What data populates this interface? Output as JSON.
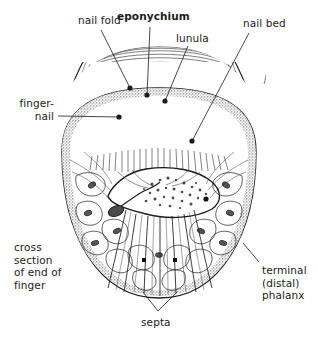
{
  "figure": {
    "title": "cross section of end of finger",
    "type": "anatomical-line-drawing",
    "background_color": "#ffffff",
    "ink_color": "#1b1b1b",
    "nail_plate_color": "#e8e8e8",
    "skin_rim_color": "#9a9a9a"
  },
  "labels": {
    "nail_fold": {
      "text": "nail fold",
      "bold": false,
      "x": 78,
      "y": 14,
      "align": "left"
    },
    "eponychium": {
      "text": "eponychium",
      "bold": true,
      "x": 117,
      "y": 10,
      "align": "left"
    },
    "lunula": {
      "text": "lunula",
      "bold": false,
      "x": 176,
      "y": 32,
      "align": "left"
    },
    "nail_bed": {
      "text": "nail bed",
      "bold": false,
      "x": 243,
      "y": 17,
      "align": "left"
    },
    "finger_nail": {
      "text": "finger-\nnail",
      "bold": false,
      "x": 22,
      "y": 97,
      "align": "right"
    },
    "cross_section": {
      "text": "cross\nsection\nof end of\nfinger",
      "bold": false,
      "x": 14,
      "y": 241,
      "align": "left"
    },
    "terminal_phalanx": {
      "text": "terminal\n(distal)\nphalanx",
      "bold": false,
      "x": 262,
      "y": 264,
      "align": "left"
    },
    "septa": {
      "text": "septa",
      "bold": false,
      "x": 141,
      "y": 316,
      "align": "left"
    }
  },
  "leaders": [
    {
      "name": "nail-fold-leader",
      "from": [
        101,
        30
      ],
      "to": [
        130,
        88
      ],
      "dot": true
    },
    {
      "name": "eponychium-leader",
      "from": [
        150,
        27
      ],
      "to": [
        147,
        95
      ],
      "dot": true
    },
    {
      "name": "lunula-leader",
      "from": [
        188,
        46
      ],
      "to": [
        165,
        101
      ],
      "dot": true
    },
    {
      "name": "nail-bed-leader",
      "from": [
        249,
        33
      ],
      "to": [
        192,
        141
      ],
      "dot": true
    },
    {
      "name": "finger-nail-leader",
      "from": [
        58,
        116
      ],
      "to": [
        119,
        117
      ],
      "dot": true
    },
    {
      "name": "terminal-phalanx-leader",
      "from": [
        259,
        262
      ],
      "to": [
        243,
        243
      ],
      "dot": false
    },
    {
      "name": "septa-leader-left",
      "from": [
        158,
        311
      ],
      "to": [
        143,
        292
      ],
      "dot": false
    },
    {
      "name": "septa-leader-right",
      "from": [
        158,
        311
      ],
      "to": [
        177,
        292
      ],
      "dot": false
    }
  ],
  "anatomy_parts": [
    {
      "name": "nail fold"
    },
    {
      "name": "eponychium"
    },
    {
      "name": "lunula"
    },
    {
      "name": "nail bed"
    },
    {
      "name": "finger-nail"
    },
    {
      "name": "terminal (distal) phalanx"
    },
    {
      "name": "septa"
    }
  ]
}
